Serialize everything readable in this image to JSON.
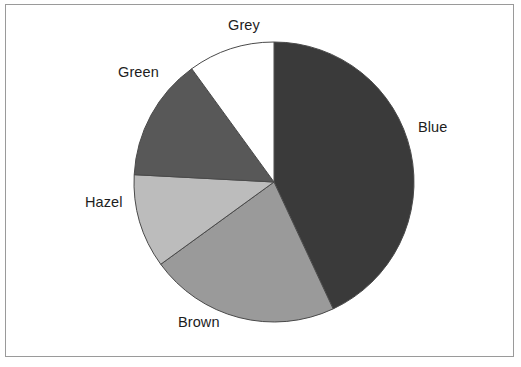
{
  "figure": {
    "border_color": "#9a9a9a",
    "background": "#ffffff"
  },
  "chart_data": {
    "type": "pie",
    "title": "",
    "subtitle": "",
    "xlabel": "",
    "ylabel": "",
    "legend_position": "none",
    "grid": false,
    "labels_position": "outside",
    "center": {
      "x": 274,
      "y": 182
    },
    "radius": 140,
    "start_angle_deg": 0,
    "direction": "clockwise",
    "categories": [
      "Blue",
      "Brown",
      "Hazel",
      "Green",
      "Grey"
    ],
    "values": [
      43,
      22,
      11,
      14,
      10
    ],
    "colors": [
      "#3a3a3a",
      "#9a9a9a",
      "#bcbcbc",
      "#585858",
      "#ffffff"
    ],
    "slices": [
      {
        "label": "Blue",
        "value": 43,
        "color": "#3a3a3a",
        "start_deg": 0,
        "end_deg": 155
      },
      {
        "label": "Brown",
        "value": 22,
        "color": "#9a9a9a",
        "start_deg": 155,
        "end_deg": 234
      },
      {
        "label": "Hazel",
        "value": 11,
        "color": "#bcbcbc",
        "start_deg": 234,
        "end_deg": 273
      },
      {
        "label": "Green",
        "value": 14,
        "color": "#585858",
        "start_deg": 273,
        "end_deg": 324
      },
      {
        "label": "Grey",
        "value": 10,
        "color": "#ffffff",
        "start_deg": 324,
        "end_deg": 360
      }
    ],
    "outline_color": "#4a4a4a",
    "outline_width": 1
  },
  "labels": {
    "grey": "Grey",
    "green": "Green",
    "hazel": "Hazel",
    "brown": "Brown",
    "blue": "Blue"
  }
}
